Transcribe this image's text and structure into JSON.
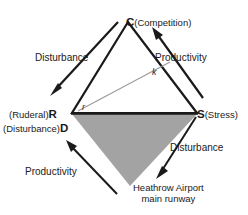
{
  "diagram": {
    "type": "csr-triangle-schematic",
    "vertices": [
      {
        "id": "C",
        "letter": "C",
        "paren": "(Competition)",
        "x": 128,
        "y": 22
      },
      {
        "id": "S",
        "letter": "S",
        "paren": "(Stress)",
        "x": 197,
        "y": 113
      },
      {
        "id": "R",
        "letter": "R",
        "paren": "(Ruderal)",
        "x": 72,
        "y": 113
      },
      {
        "id": "D",
        "letter": "D",
        "paren": "(Disturbance)",
        "x": 72,
        "y": 113
      }
    ],
    "flows": [
      {
        "id": "disturbance-top-left",
        "label": "Disturbance",
        "direction": "down-left"
      },
      {
        "id": "productivity-top-right",
        "label": "Productivity",
        "direction": "up-right"
      },
      {
        "id": "productivity-bottom-left",
        "label": "Productivity",
        "direction": "up-left"
      },
      {
        "id": "disturbance-bottom-right",
        "label": "Disturbance",
        "direction": "down-left"
      }
    ],
    "axis_annotations": [
      {
        "id": "k",
        "label": "k"
      },
      {
        "id": "r",
        "label": "r"
      }
    ],
    "caption": {
      "line1": "Heathrow Airport",
      "line2": "main runway"
    },
    "colors": {
      "outline": "#1a1a1a",
      "shaded_fill": "#a3a3a3",
      "axis_line": "#9a9a9a",
      "text": "#1a1a1a",
      "background": "#ffffff"
    }
  }
}
